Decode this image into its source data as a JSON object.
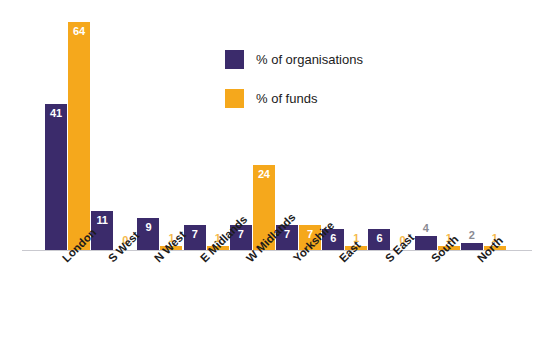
{
  "chart_data": {
    "type": "bar",
    "title": "",
    "xlabel": "",
    "ylabel": "",
    "ylim": [
      0,
      64
    ],
    "grid": false,
    "legend_position": "top-center",
    "categories": [
      "London",
      "S West",
      "N West",
      "E Midlands",
      "W Midlands",
      "Yorkshire",
      "East",
      "S East",
      "South",
      "North"
    ],
    "series": [
      {
        "name": "% of organisations",
        "color": "#3b2b6b",
        "values": [
          41,
          11,
          9,
          7,
          7,
          7,
          6,
          6,
          4,
          2
        ]
      },
      {
        "name": "% of funds",
        "color": "#f5a81c",
        "values": [
          64,
          0,
          1,
          1,
          24,
          7,
          1,
          0,
          1,
          1
        ]
      }
    ]
  },
  "legend": {
    "items": [
      {
        "label": "% of organisations",
        "swatch": "purple-swatch"
      },
      {
        "label": "% of funds",
        "swatch": "orange-swatch"
      }
    ]
  },
  "colors": {
    "organisations": "#3b2b6b",
    "funds": "#f5a81c",
    "baseline": "#c9c9cf",
    "label_inside": "#ffffff",
    "label_outside_org": "#8a8a93",
    "label_outside_fun": "#f5b94a",
    "background": "#ffffff"
  }
}
